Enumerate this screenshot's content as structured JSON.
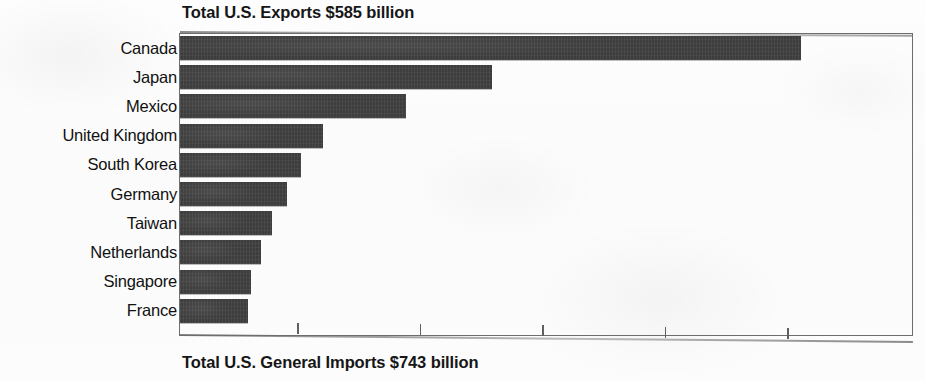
{
  "chart_data": {
    "type": "bar",
    "orientation": "horizontal",
    "title": "Total U.S. Exports $585 billion",
    "footer": "Total U.S. General Imports $743 billion",
    "xlabel": "",
    "ylabel": "",
    "grid": false,
    "legend": null,
    "axis_tick_labels": [],
    "axis_tick_count": 5,
    "axis_unit": "$ billion",
    "xlim": [
      0,
      160
    ],
    "categories": [
      "Canada",
      "Japan",
      "Mexico",
      "United Kingdom",
      "South Korea",
      "Germany",
      "Taiwan",
      "Netherlands",
      "Singapore",
      "France"
    ],
    "values": [
      154,
      77,
      56,
      36,
      30,
      27,
      23,
      20,
      18,
      17
    ],
    "bar_pixel_lengths": [
      621,
      312,
      226,
      143,
      121,
      107,
      92,
      81,
      71,
      68
    ],
    "bar_color": "#3d3d3d",
    "frame_color": "#6d6d6d",
    "text_color": "#111111"
  },
  "chart": {
    "title": "Total U.S. Exports $585 billion",
    "footer": "Total U.S. General Imports $743 billion"
  }
}
